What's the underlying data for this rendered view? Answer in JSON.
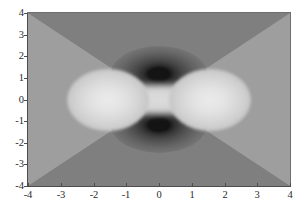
{
  "figure": {
    "background_color": "#ffffff",
    "plot_background_color": "#8e8e8e"
  },
  "axes": {
    "x_tick_labels": [
      "-4",
      "-3",
      "-2",
      "-1",
      "0",
      "1",
      "2",
      "3",
      "4"
    ],
    "y_tick_labels": [
      "4",
      "3",
      "2",
      "1",
      "0",
      "-1",
      "-2",
      "-3",
      "-4"
    ],
    "xlabel": "",
    "ylabel": "",
    "title": ""
  },
  "chart_data": {
    "type": "heatmap",
    "title": "",
    "subtitle": "",
    "xlabel": "",
    "ylabel": "",
    "xlim": [
      -4,
      4
    ],
    "ylim": [
      -4,
      4
    ],
    "xticks": [
      -4,
      -3,
      -2,
      -1,
      0,
      1,
      2,
      3,
      4
    ],
    "yticks": [
      -4,
      -3,
      -2,
      -1,
      0,
      1,
      2,
      3,
      4
    ],
    "grid": false,
    "legend": "none",
    "colormap": "gray",
    "colorbar": false,
    "annotations": [],
    "features": [
      {
        "name": "bright-lobe-left",
        "kind": "maximum",
        "center": [
          -2.0,
          0.0
        ],
        "radius_x": 1.2,
        "radius_y": 0.85,
        "level": "high",
        "gray_hex": "#eaeaea"
      },
      {
        "name": "bright-lobe-right",
        "kind": "maximum",
        "center": [
          2.0,
          0.0
        ],
        "radius_x": 1.2,
        "radius_y": 0.85,
        "level": "high",
        "gray_hex": "#eaeaea"
      },
      {
        "name": "bright-bridge",
        "kind": "ridge",
        "center": [
          0.0,
          0.0
        ],
        "radius_x": 2.6,
        "radius_y": 0.4,
        "level": "mid-high",
        "gray_hex": "#d6d6d6"
      },
      {
        "name": "dark-blob-top",
        "kind": "minimum",
        "center": [
          0.0,
          1.8
        ],
        "radius_x": 1.45,
        "radius_y": 0.8,
        "level": "low",
        "gray_hex": "#141414"
      },
      {
        "name": "dark-blob-bottom",
        "kind": "minimum",
        "center": [
          0.0,
          -1.8
        ],
        "radius_x": 1.45,
        "radius_y": 0.8,
        "level": "low",
        "gray_hex": "#141414"
      },
      {
        "name": "wedge-top",
        "kind": "background-band",
        "level": "mid-low",
        "gray_hex": "#7f7f7f"
      },
      {
        "name": "wedge-bottom",
        "kind": "background-band",
        "level": "mid-low",
        "gray_hex": "#7f7f7f"
      },
      {
        "name": "wedge-left",
        "kind": "background-band",
        "level": "mid",
        "gray_hex": "#9e9e9e"
      },
      {
        "name": "wedge-right",
        "kind": "background-band",
        "level": "mid",
        "gray_hex": "#9e9e9e"
      }
    ],
    "gray_levels": [
      "#141414",
      "#2f2f2f",
      "#454545",
      "#565656",
      "#666666",
      "#727272",
      "#7f7f7f",
      "#8e8e8e",
      "#9e9e9e",
      "#c3c3c3",
      "#d6d6d6",
      "#eaeaea"
    ]
  }
}
